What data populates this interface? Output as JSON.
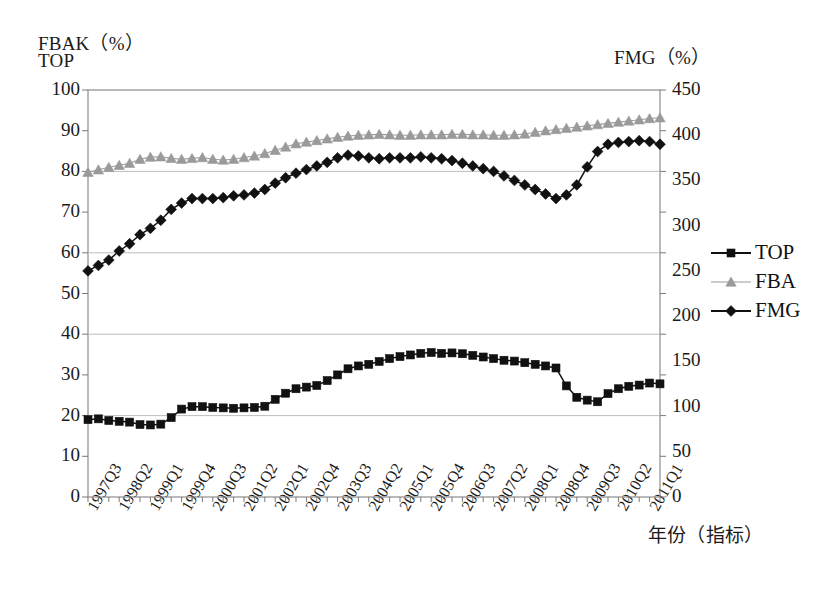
{
  "axes": {
    "left_title_line1": "FBAK（%）",
    "left_title_line2": "TOP",
    "right_title": "FMG（%）",
    "x_title": "年份（指标）",
    "left_ticks": [
      "100",
      "90",
      "80",
      "70",
      "60",
      "50",
      "40",
      "30",
      "20",
      "10",
      "0"
    ],
    "right_ticks": [
      "450",
      "400",
      "350",
      "300",
      "250",
      "200",
      "150",
      "100",
      "50",
      "0"
    ]
  },
  "legend": {
    "items": [
      {
        "label": "TOP",
        "marker": "square-marker",
        "color": "#111111"
      },
      {
        "label": "FBA",
        "marker": "triangle-marker",
        "color": "#9a9a9a"
      },
      {
        "label": "FMG",
        "marker": "diamond-marker",
        "color": "#111111"
      }
    ]
  },
  "chart_data": {
    "type": "line",
    "title": "",
    "xlabel": "年份（指标）",
    "ylabel": "FBAK（%） TOP",
    "y2label": "FMG（%）",
    "ylim": [
      0,
      100
    ],
    "y2lim": [
      0,
      450
    ],
    "grid": true,
    "legend_position": "right",
    "x_tick_labels": [
      "1997Q3",
      "1998Q2",
      "1999Q1",
      "1999Q4",
      "2000Q3",
      "2001Q2",
      "2002Q1",
      "2002Q4",
      "2003Q3",
      "2004Q2",
      "2005Q1",
      "2005Q4",
      "2006Q3",
      "2007Q2",
      "2008Q1",
      "2008Q4",
      "2009Q3",
      "2010Q2",
      "2011Q1"
    ],
    "x": [
      "1997Q3",
      "1997Q4",
      "1998Q1",
      "1998Q2",
      "1998Q3",
      "1998Q4",
      "1999Q1",
      "1999Q2",
      "1999Q3",
      "1999Q4",
      "2000Q1",
      "2000Q2",
      "2000Q3",
      "2000Q4",
      "2001Q1",
      "2001Q2",
      "2001Q3",
      "2001Q4",
      "2002Q1",
      "2002Q2",
      "2002Q3",
      "2002Q4",
      "2003Q1",
      "2003Q2",
      "2003Q3",
      "2003Q4",
      "2004Q1",
      "2004Q2",
      "2004Q3",
      "2004Q4",
      "2005Q1",
      "2005Q2",
      "2005Q3",
      "2005Q4",
      "2006Q1",
      "2006Q2",
      "2006Q3",
      "2006Q4",
      "2007Q1",
      "2007Q2",
      "2007Q3",
      "2007Q4",
      "2008Q1",
      "2008Q2",
      "2008Q3",
      "2008Q4",
      "2009Q1",
      "2009Q2",
      "2009Q3",
      "2009Q4",
      "2010Q1",
      "2010Q2",
      "2010Q3",
      "2010Q4",
      "2011Q1",
      "2011Q2"
    ],
    "series": [
      {
        "name": "TOP",
        "axis": "left",
        "marker": "square",
        "color": "#111111",
        "values": [
          19.0,
          19.2,
          18.8,
          18.6,
          18.4,
          17.8,
          17.7,
          17.9,
          19.5,
          21.6,
          22.2,
          22.2,
          22.0,
          21.9,
          21.8,
          21.9,
          22.0,
          22.3,
          24.0,
          25.5,
          26.6,
          27.0,
          27.4,
          28.6,
          30.0,
          31.5,
          32.2,
          32.6,
          33.3,
          34.0,
          34.5,
          34.9,
          35.3,
          35.5,
          35.3,
          35.4,
          35.2,
          34.8,
          34.4,
          34.0,
          33.6,
          33.4,
          33.0,
          32.6,
          32.2,
          31.7,
          27.3,
          24.5,
          23.8,
          23.4,
          25.4,
          26.6,
          27.2,
          27.5,
          28.0,
          27.8
        ]
      },
      {
        "name": "FBAK",
        "axis": "left",
        "marker": "triangle",
        "color": "#9a9a9a",
        "values": [
          79.8,
          80.4,
          81.0,
          81.5,
          82.0,
          83.0,
          83.5,
          83.6,
          83.2,
          83.0,
          83.2,
          83.4,
          83.0,
          82.8,
          83.0,
          83.4,
          83.8,
          84.4,
          85.2,
          86.0,
          86.8,
          87.2,
          87.6,
          88.0,
          88.4,
          88.7,
          88.9,
          89.0,
          89.1,
          89.0,
          88.9,
          88.9,
          89.0,
          89.0,
          89.0,
          89.1,
          89.1,
          89.0,
          89.0,
          88.9,
          88.9,
          89.0,
          89.2,
          89.6,
          90.0,
          90.3,
          90.6,
          90.9,
          91.2,
          91.5,
          91.8,
          92.1,
          92.4,
          92.7,
          93.0,
          93.2
        ]
      },
      {
        "name": "FMG",
        "axis": "right",
        "marker": "diamond",
        "color": "#111111",
        "values": [
          250,
          256,
          262,
          272,
          280,
          290,
          297,
          306,
          318,
          325,
          330,
          330,
          330,
          331,
          333,
          334,
          336,
          340,
          347,
          353,
          358,
          362,
          366,
          370,
          375,
          378,
          377,
          375,
          374,
          375,
          375,
          375,
          376,
          375,
          374,
          372,
          369,
          366,
          363,
          360,
          355,
          350,
          345,
          340,
          335,
          330,
          334,
          345,
          365,
          382,
          390,
          392,
          393,
          394,
          393,
          390
        ]
      }
    ]
  }
}
